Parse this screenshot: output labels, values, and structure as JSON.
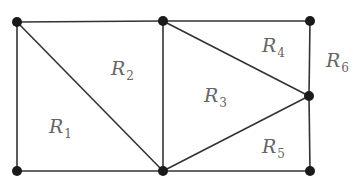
{
  "diagram": {
    "type": "planar-graph",
    "vertices": [
      {
        "id": "A",
        "position": "top-left"
      },
      {
        "id": "B",
        "position": "top-middle"
      },
      {
        "id": "C",
        "position": "top-right"
      },
      {
        "id": "D",
        "position": "right-middle"
      },
      {
        "id": "E",
        "position": "bottom-middle"
      },
      {
        "id": "F",
        "position": "bottom-left"
      },
      {
        "id": "G",
        "position": "bottom-right"
      }
    ],
    "edges": [
      [
        "A",
        "B"
      ],
      [
        "B",
        "C"
      ],
      [
        "C",
        "D"
      ],
      [
        "D",
        "G"
      ],
      [
        "G",
        "E"
      ],
      [
        "E",
        "F"
      ],
      [
        "F",
        "A"
      ],
      [
        "A",
        "E"
      ],
      [
        "B",
        "E"
      ],
      [
        "B",
        "D"
      ],
      [
        "D",
        "E"
      ]
    ],
    "regions": [
      {
        "base": "R",
        "sub": "1"
      },
      {
        "base": "R",
        "sub": "2"
      },
      {
        "base": "R",
        "sub": "3"
      },
      {
        "base": "R",
        "sub": "4"
      },
      {
        "base": "R",
        "sub": "5"
      },
      {
        "base": "R",
        "sub": "6"
      }
    ]
  }
}
